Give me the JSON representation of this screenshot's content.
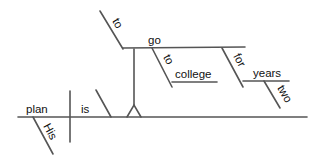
{
  "diagram": {
    "type": "sentence-diagram",
    "sentence": "His plan is to go to college for two years.",
    "colors": {
      "line": "#555555",
      "text": "#111111",
      "background": "#ffffff"
    },
    "words": {
      "subject": "plan",
      "verb": "is",
      "subject_modifier": "His",
      "infinitive_marker": "to",
      "infinitive_verb": "go",
      "prep1": "to",
      "prep1_object": "college",
      "prep2": "for",
      "prep2_object": "years",
      "prep2_object_modifier": "two"
    }
  }
}
